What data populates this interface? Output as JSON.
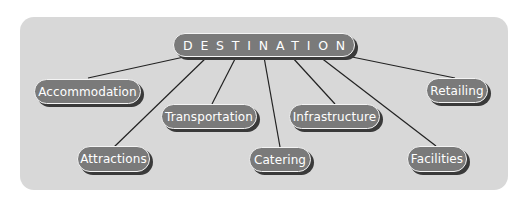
{
  "diagram": {
    "type": "hub-and-spoke",
    "colors": {
      "panel": "#d8d8d8",
      "pill_fill": "#7a7a7a",
      "pill_text": "#ffffff",
      "pill_outline": "#f4f4f4",
      "pill_shadow": "#3a3a3a",
      "connector": "#222222"
    },
    "root": {
      "label": "DESTINATION"
    },
    "nodes": [
      {
        "id": "accommodation",
        "label": "Accommodation"
      },
      {
        "id": "attractions",
        "label": "Attractions"
      },
      {
        "id": "transportation",
        "label": "Transportation"
      },
      {
        "id": "catering",
        "label": "Catering"
      },
      {
        "id": "infrastructure",
        "label": "Infrastructure"
      },
      {
        "id": "facilities",
        "label": "Facilities"
      },
      {
        "id": "retailing",
        "label": "Retailing"
      }
    ],
    "edges": [
      {
        "from": "DESTINATION",
        "to": "Accommodation"
      },
      {
        "from": "DESTINATION",
        "to": "Attractions"
      },
      {
        "from": "DESTINATION",
        "to": "Transportation"
      },
      {
        "from": "DESTINATION",
        "to": "Catering"
      },
      {
        "from": "DESTINATION",
        "to": "Infrastructure"
      },
      {
        "from": "DESTINATION",
        "to": "Facilities"
      },
      {
        "from": "DESTINATION",
        "to": "Retailing"
      }
    ]
  }
}
